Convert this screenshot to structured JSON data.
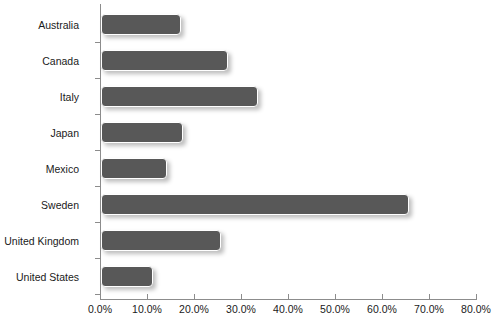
{
  "chart_data": {
    "type": "bar",
    "orientation": "horizontal",
    "title": "",
    "xlabel": "",
    "ylabel": "",
    "categories": [
      "Australia",
      "Canada",
      "Italy",
      "Japan",
      "Mexico",
      "Sweden",
      "United Kingdom",
      "United States"
    ],
    "values": [
      17.0,
      27.0,
      33.5,
      17.5,
      14.0,
      65.5,
      25.5,
      11.0
    ],
    "value_labels": [
      "17.0%",
      "27.0%",
      "33.5%",
      "17.5%",
      "14.0%",
      "65.5%",
      "25.5%",
      "11.0%"
    ],
    "xlim": [
      0,
      80
    ],
    "xticks": [
      0,
      10,
      20,
      30,
      40,
      50,
      60,
      70,
      80
    ],
    "xtick_labels": [
      "0.0%",
      "10.0%",
      "20.0%",
      "30.0%",
      "40.0%",
      "50.0%",
      "60.0%",
      "70.0%",
      "80.0%"
    ],
    "grid": false,
    "legend": null,
    "bar_color": "#585858",
    "bar_border_color": "#ffffff",
    "axis_color": "#8c8c8c",
    "text_color": "#1a1a1a",
    "background": "#ffffff"
  }
}
